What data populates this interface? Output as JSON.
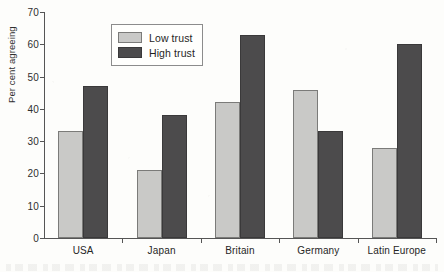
{
  "chart_data": {
    "type": "bar",
    "title": "",
    "subtitle": "",
    "xlabel": "",
    "ylabel": "Per cent agreeing",
    "ylim": [
      0,
      70
    ],
    "ytick_step": 10,
    "yticks": [
      0,
      10,
      20,
      30,
      40,
      50,
      60,
      70
    ],
    "ytick_labels": [
      "0",
      "10",
      "20",
      "30",
      "40",
      "50",
      "60",
      "70"
    ],
    "grid": false,
    "legend_position": "upper-left-inside",
    "categories": [
      "USA",
      "Japan",
      "Britain",
      "Germany",
      "Latin Europe"
    ],
    "series": [
      {
        "name": "Low trust",
        "color": "#c9c9c7",
        "values": [
          33,
          21,
          42,
          46,
          28
        ]
      },
      {
        "name": "High trust",
        "color": "#4c4b4c",
        "values": [
          47,
          38,
          63,
          33,
          60
        ]
      }
    ],
    "annotations": []
  },
  "axes": {
    "y_title": "Per cent agreeing"
  },
  "legend": {
    "entries": [
      {
        "label": "Low trust",
        "swatch": "low-trust-swatch"
      },
      {
        "label": "High trust",
        "swatch": "high-trust-swatch"
      }
    ]
  },
  "caption": {
    "text": ""
  }
}
